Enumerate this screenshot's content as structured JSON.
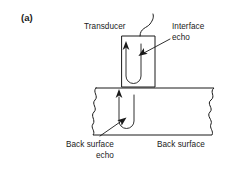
{
  "figure": {
    "panel_label": "(a)",
    "labels": {
      "transducer": "Transducer",
      "interface_echo_line1": "Interface",
      "interface_echo_line2": "echo",
      "back_surface_echo_line1": "Back surface",
      "back_surface_echo_line2": "echo",
      "back_surface": "Back surface"
    },
    "icons": {
      "cable": "cable-curve-icon",
      "transducer_body": "transducer-box-icon",
      "specimen": "specimen-block-icon",
      "interface_beam": "interface-echo-beam-icon",
      "back_surface_beam": "back-surface-echo-beam-icon",
      "leader_interface": "leader-arrow-icon",
      "leader_back_surface": "leader-arrow-icon",
      "break_edge_left": "broken-edge-icon",
      "break_edge_right": "broken-edge-icon"
    },
    "colors": {
      "ink": "#1a1a1a",
      "background": "#ffffff"
    }
  }
}
